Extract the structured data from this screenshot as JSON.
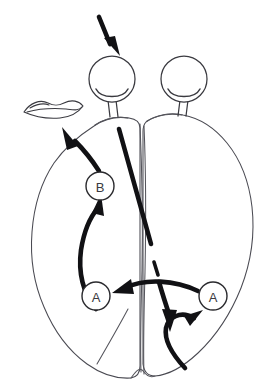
{
  "figure": {
    "background_color": "#ffffff",
    "line_color": "#3a3a40",
    "outline_color": "#4a4a52",
    "emphasis_color": "#111114",
    "width": 276,
    "height": 389
  },
  "nodes": [
    {
      "id": "node-b",
      "label": "B",
      "cx": 100,
      "cy": 186,
      "r": 14
    },
    {
      "id": "node-a-left",
      "label": "A",
      "cx": 96,
      "cy": 296,
      "r": 14
    },
    {
      "id": "node-a-right",
      "label": "A",
      "cx": 213,
      "cy": 296,
      "r": 14
    }
  ],
  "organs": {
    "eye_left": {
      "name": "eye-left",
      "cx": 112,
      "cy": 79,
      "r": 23
    },
    "eye_right": {
      "name": "eye-right",
      "cx": 184,
      "cy": 79,
      "r": 23
    },
    "mouth": {
      "name": "mouth-lips",
      "cx": 52,
      "cy": 110
    }
  },
  "arrows": {
    "input_arrow": {
      "name": "input-stimulus-arrow",
      "from": "above",
      "to": "eye-left"
    },
    "b_to_mouth": {
      "name": "arrow-b-to-mouth",
      "from": "B",
      "to": "mouth"
    },
    "a_left_to_b": {
      "name": "arrow-a-left-to-b",
      "from": "A-left",
      "to": "B"
    },
    "a_right_to_a_left": {
      "name": "arrow-a-right-to-a-left",
      "from": "A-right",
      "to": "A-left"
    },
    "callosum_down": {
      "name": "arrow-callosum-descending",
      "from": "left-hemisphere",
      "to": "right-hemisphere"
    },
    "to_a_right": {
      "name": "arrow-to-a-right",
      "from": "midline",
      "to": "A-right"
    }
  },
  "watermarks": {
    "left": "",
    "right": ""
  }
}
